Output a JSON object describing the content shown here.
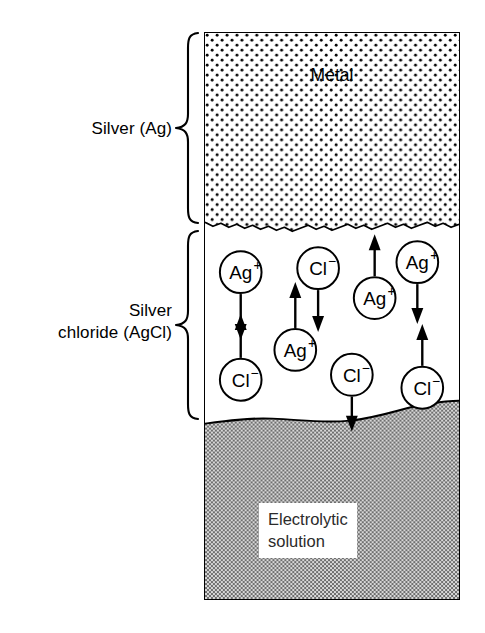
{
  "figure": {
    "type": "cross-section-diagram"
  },
  "labels": {
    "silver": "Silver (Ag)",
    "silver_chloride": "Silver\nchloride (AgCl)"
  },
  "layers": {
    "metal": {
      "name": "metal-layer",
      "text": "Metal",
      "fill": "#ffffff",
      "pattern": "black-dot-stipple",
      "pattern_color": "#000000"
    },
    "silver_chloride": {
      "name": "silver-chloride-layer",
      "text": "",
      "fill": "#ffffff",
      "pattern": "none"
    },
    "electrolyte": {
      "name": "electrolyte-layer",
      "text": "Electrolytic\nsolution",
      "fill": "#9c9c9c",
      "pattern": "gray-halftone-checker",
      "pattern_color": "#808080"
    }
  },
  "ions": [
    {
      "label": "Ag",
      "charge": "+",
      "arrow": "down"
    },
    {
      "label": "Cl",
      "charge": "−",
      "arrow": "up"
    },
    {
      "label": "Cl",
      "charge": "−",
      "arrow": "down"
    },
    {
      "label": "Ag",
      "charge": "+",
      "arrow": "up"
    },
    {
      "label": "Ag",
      "charge": "+",
      "arrow": "up"
    },
    {
      "label": "Cl",
      "charge": "−",
      "arrow": "down"
    },
    {
      "label": "Ag",
      "charge": "+",
      "arrow": "down"
    },
    {
      "label": "Cl",
      "charge": "−",
      "arrow": "up"
    }
  ],
  "colors": {
    "ink": "#000000",
    "page": "#ffffff",
    "electrolyte_gray": "#9c9c9c"
  }
}
